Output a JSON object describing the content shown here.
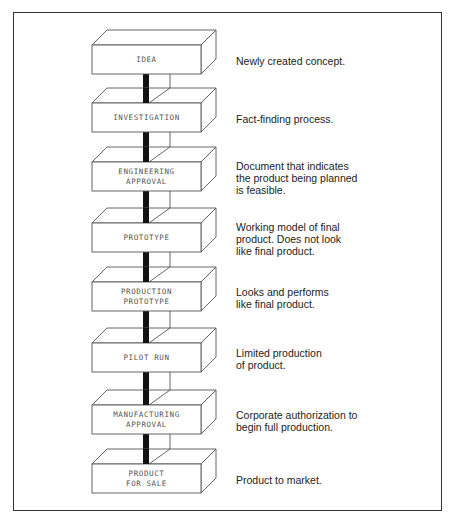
{
  "diagram": {
    "title": "",
    "stages": [
      {
        "label_lines": [
          "IDEA"
        ],
        "description_lines": [
          "Newly created concept."
        ],
        "front_top": 45
      },
      {
        "label_lines": [
          "INVESTIGATION"
        ],
        "description_lines": [
          "Fact-finding process."
        ],
        "front_top": 103
      },
      {
        "label_lines": [
          "ENGINEERING",
          "APPROVAL"
        ],
        "description_lines": [
          "Document that indicates",
          "the product being planned",
          "is feasible."
        ],
        "front_top": 162
      },
      {
        "label_lines": [
          "PROTOTYPE"
        ],
        "description_lines": [
          "Working model of final",
          "product. Does not look",
          "like final product."
        ],
        "front_top": 223
      },
      {
        "label_lines": [
          "PRODUCTION",
          "PROTOTYPE"
        ],
        "description_lines": [
          "Looks and performs",
          "like final product."
        ],
        "front_top": 282
      },
      {
        "label_lines": [
          "PILOT RUN"
        ],
        "description_lines": [
          "Limited production",
          "of product."
        ],
        "front_top": 343
      },
      {
        "label_lines": [
          "MANUFACTURING",
          "APPROVAL"
        ],
        "description_lines": [
          "Corporate authorization to",
          "begin full production."
        ],
        "front_top": 405
      },
      {
        "label_lines": [
          "PRODUCT",
          "FOR SALE"
        ],
        "description_lines": [
          "Product to market."
        ],
        "front_top": 464
      }
    ],
    "colors": {
      "box_stroke": "#555555",
      "connector": "#111111",
      "label_text": "#555555",
      "description_text": "#222222",
      "frame": "#333333"
    }
  }
}
